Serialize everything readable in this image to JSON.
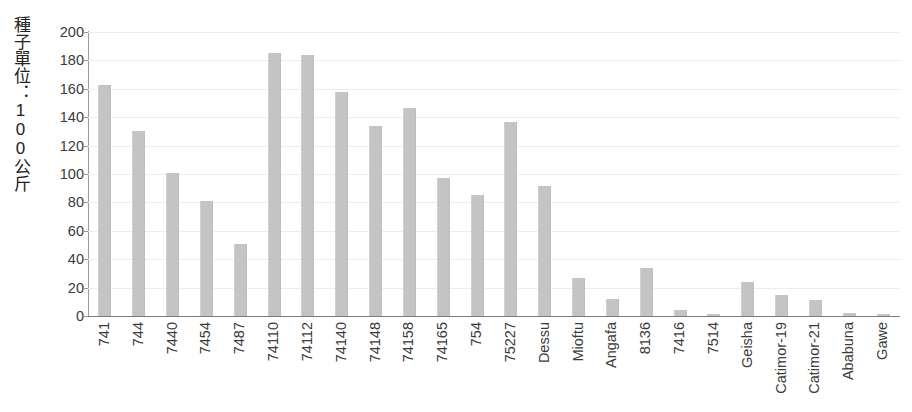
{
  "chart_data": {
    "type": "bar",
    "title": "",
    "xlabel": "",
    "ylabel": "種子單位：100公斤",
    "ylim": [
      0,
      200
    ],
    "ytick_step": 20,
    "yticks": [
      0,
      20,
      40,
      60,
      80,
      100,
      120,
      140,
      160,
      180,
      200
    ],
    "grid": true,
    "legend": false,
    "bar_color": "#c4c4c4",
    "categories": [
      "741",
      "744",
      "7440",
      "7454",
      "7487",
      "74110",
      "74112",
      "74140",
      "74148",
      "74158",
      "74165",
      "754",
      "75227",
      "Dessu",
      "Mioftu",
      "Angafa",
      "8136",
      "7416",
      "7514",
      "Geisha",
      "Catimor-19",
      "Catimor-21",
      "Ababuna",
      "Gawe"
    ],
    "values": [
      163,
      130,
      100.5,
      81,
      51,
      185,
      184,
      158,
      134,
      146.5,
      97.5,
      85.5,
      136.5,
      91.5,
      27,
      12,
      34,
      4,
      1.5,
      24,
      15,
      11,
      2,
      1.5
    ]
  },
  "colors": {
    "bar": "#c4c4c4",
    "axis": "#7d7d7d",
    "grid": "#ededed",
    "text": "#3b3b3b"
  }
}
